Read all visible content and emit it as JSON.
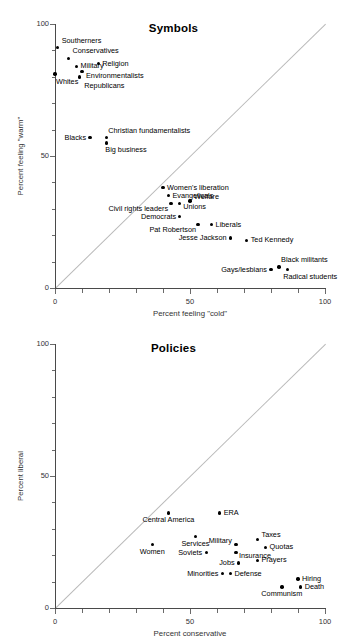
{
  "figure": {
    "background": "#ffffff",
    "dot_color": "#000000",
    "diagonal_color": "#b9b9b9",
    "axis_color": "#4a4a4a"
  },
  "chart_data": [
    {
      "type": "scatter",
      "title": "Symbols",
      "xlabel": "Percent feeling \"cold\"",
      "ylabel": "Percent feeling \"warm\"",
      "xlim": [
        0,
        100
      ],
      "ylim": [
        0,
        100
      ],
      "xticks": [
        0,
        50,
        100
      ],
      "yticks": [
        0,
        50,
        100
      ],
      "xtick_labels": [
        "0",
        "50",
        "100"
      ],
      "ytick_labels": [
        "0",
        "50",
        "100"
      ],
      "grid": false,
      "legend": "none",
      "annotations": [
        "diagonal reference line y = x"
      ],
      "points": [
        {
          "label": "Southerners",
          "x": 1,
          "y": 91,
          "side": "l",
          "dx": 4,
          "dy": -7
        },
        {
          "label": "Conservatives",
          "x": 5,
          "y": 87,
          "side": "l",
          "dx": 4,
          "dy": -7
        },
        {
          "label": "Military",
          "x": 8,
          "y": 84,
          "side": "l",
          "dx": 4,
          "dy": 0
        },
        {
          "label": "Religion",
          "x": 16,
          "y": 85,
          "side": "l",
          "dx": 4,
          "dy": 0
        },
        {
          "label": "Environmentalists",
          "x": 10,
          "y": 82,
          "side": "l",
          "dx": 4,
          "dy": 4.5
        },
        {
          "label": "Whites",
          "x": 0,
          "y": 81,
          "side": "l",
          "dx": 1,
          "dy": 8
        },
        {
          "label": "Republicans",
          "x": 9,
          "y": 80,
          "side": "l",
          "dx": 5,
          "dy": 9.5
        },
        {
          "label": "Blacks",
          "x": 13,
          "y": 57,
          "side": "r",
          "dx": -4,
          "dy": 0
        },
        {
          "label": "Christian fundamentalists",
          "x": 19,
          "y": 57,
          "side": "l",
          "dx": 2,
          "dy": -7
        },
        {
          "label": "Big business",
          "x": 19,
          "y": 55,
          "side": "l",
          "dx": -1,
          "dy": 7
        },
        {
          "label": "Women's liberation",
          "x": 40,
          "y": 38,
          "side": "l",
          "dx": 4,
          "dy": 0
        },
        {
          "label": "Evangelicals",
          "x": 42,
          "y": 35,
          "side": "l",
          "dx": 4,
          "dy": 0
        },
        {
          "label": "Welfare",
          "x": 50,
          "y": 33,
          "side": "l",
          "dx": 4,
          "dy": -4
        },
        {
          "label": "Unions",
          "x": 46,
          "y": 32,
          "side": "l",
          "dx": 4,
          "dy": 3
        },
        {
          "label": "Civil rights leaders",
          "x": 43,
          "y": 32,
          "side": "r",
          "dx": -3,
          "dy": 5
        },
        {
          "label": "Democrats",
          "x": 46,
          "y": 27,
          "side": "r",
          "dx": -3,
          "dy": 0
        },
        {
          "label": "Liberals",
          "x": 58,
          "y": 24,
          "side": "l",
          "dx": 4,
          "dy": 0
        },
        {
          "label": "Pat Robertson",
          "x": 53,
          "y": 24,
          "side": "r",
          "dx": -2,
          "dy": 5
        },
        {
          "label": "Jesse Jackson",
          "x": 65,
          "y": 19,
          "side": "r",
          "dx": -4,
          "dy": 0
        },
        {
          "label": "Ted Kennedy",
          "x": 71,
          "y": 18,
          "side": "l",
          "dx": 4,
          "dy": 0
        },
        {
          "label": "Black militants",
          "x": 83,
          "y": 8,
          "side": "l",
          "dx": 2,
          "dy": -7
        },
        {
          "label": "Gays/lesbians",
          "x": 80,
          "y": 7,
          "side": "r",
          "dx": -4,
          "dy": 0
        },
        {
          "label": "Radical students",
          "x": 86,
          "y": 7,
          "side": "l",
          "dx": -4,
          "dy": 7.5
        }
      ]
    },
    {
      "type": "scatter",
      "title": "Policies",
      "xlabel": "Percent conservative",
      "ylabel": "Percent liberal",
      "xlim": [
        0,
        100
      ],
      "ylim": [
        0,
        100
      ],
      "xticks": [
        0,
        50,
        100
      ],
      "yticks": [
        0,
        50,
        100
      ],
      "xtick_labels": [
        "0",
        "50",
        "100"
      ],
      "ytick_labels": [
        "0",
        "50",
        "100"
      ],
      "grid": false,
      "legend": "none",
      "annotations": [
        "diagonal reference line y = x"
      ],
      "points": [
        {
          "label": "Central America",
          "x": 42,
          "y": 36,
          "side": "c",
          "dx": 0,
          "dy": 7
        },
        {
          "label": "ERA",
          "x": 61,
          "y": 36,
          "side": "l",
          "dx": 4,
          "dy": 0
        },
        {
          "label": "Services",
          "x": 52,
          "y": 27,
          "side": "c",
          "dx": 0,
          "dy": 7
        },
        {
          "label": "Taxes",
          "x": 75,
          "y": 26,
          "side": "l",
          "dx": 4,
          "dy": -4
        },
        {
          "label": "Military",
          "x": 67,
          "y": 24,
          "side": "r",
          "dx": -4,
          "dy": -4
        },
        {
          "label": "Women",
          "x": 36,
          "y": 24,
          "side": "c",
          "dx": 0,
          "dy": 7
        },
        {
          "label": "Quotas",
          "x": 78,
          "y": 23,
          "side": "l",
          "dx": 4,
          "dy": 0
        },
        {
          "label": "Soviets",
          "x": 56,
          "y": 21,
          "side": "r",
          "dx": -4,
          "dy": 0
        },
        {
          "label": "Insurance",
          "x": 67,
          "y": 21,
          "side": "l",
          "dx": 3,
          "dy": 3
        },
        {
          "label": "Prayers",
          "x": 75,
          "y": 18,
          "side": "l",
          "dx": 4,
          "dy": 0
        },
        {
          "label": "Jobs",
          "x": 68,
          "y": 17,
          "side": "r",
          "dx": -4,
          "dy": 0
        },
        {
          "label": "Defense",
          "x": 65,
          "y": 13,
          "side": "l",
          "dx": 4,
          "dy": 0
        },
        {
          "label": "Minorities",
          "x": 62,
          "y": 13,
          "side": "r",
          "dx": -4,
          "dy": 0
        },
        {
          "label": "Hiring",
          "x": 90,
          "y": 11,
          "side": "l",
          "dx": 4,
          "dy": 0
        },
        {
          "label": "Death",
          "x": 91,
          "y": 8,
          "side": "l",
          "dx": 4,
          "dy": 0
        },
        {
          "label": "Communism",
          "x": 84,
          "y": 8,
          "side": "c",
          "dx": 0,
          "dy": 7.5
        }
      ]
    }
  ]
}
